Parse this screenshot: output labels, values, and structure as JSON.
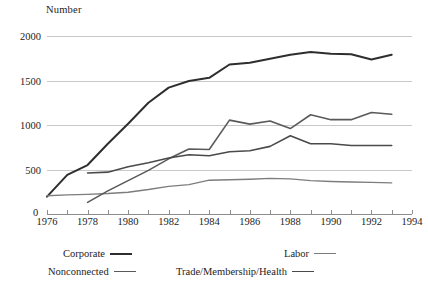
{
  "chart_data": {
    "type": "line",
    "title": "",
    "ylabel": "Number",
    "xlabel": "",
    "xlim": [
      1976,
      1994
    ],
    "ylim": [
      0,
      2000
    ],
    "grid": true,
    "legend_position": "bottom",
    "y_ticks": [
      0,
      500,
      1000,
      1500,
      2000
    ],
    "y_tick_labels": [
      "0",
      "500",
      "1000",
      "1500",
      "2000"
    ],
    "x_ticks": [
      1976,
      1978,
      1980,
      1982,
      1984,
      1986,
      1988,
      1990,
      1992,
      1994
    ],
    "x_tick_labels": [
      "1976",
      "1978",
      "1980",
      "1982",
      "1984",
      "1986",
      "1988",
      "1990",
      "1992",
      "1994"
    ],
    "x_minor_ticks": [
      1976,
      1977,
      1978,
      1979,
      1980,
      1981,
      1982,
      1983,
      1984,
      1985,
      1986,
      1987,
      1988,
      1989,
      1990,
      1991,
      1992,
      1993,
      1994
    ],
    "series": [
      {
        "name": "Corporate",
        "color": "#2e2e2e",
        "width": 2.0,
        "x": [
          1976,
          1977,
          1978,
          1979,
          1980,
          1981,
          1982,
          1983,
          1984,
          1985,
          1986,
          1987,
          1988,
          1989,
          1990,
          1991,
          1992,
          1993
        ],
        "values": [
          195,
          440,
          550,
          790,
          1015,
          1250,
          1420,
          1495,
          1530,
          1680,
          1700,
          1745,
          1790,
          1820,
          1800,
          1795,
          1735,
          1790
        ]
      },
      {
        "name": "Labor",
        "color": "#7d7d7d",
        "width": 1.4,
        "x": [
          1976,
          1977,
          1978,
          1979,
          1980,
          1981,
          1982,
          1983,
          1984,
          1985,
          1986,
          1987,
          1988,
          1989,
          1990,
          1991,
          1992,
          1993
        ],
        "values": [
          205,
          215,
          220,
          230,
          245,
          275,
          310,
          330,
          380,
          385,
          390,
          400,
          395,
          375,
          365,
          360,
          355,
          350
        ]
      },
      {
        "name": "Nonconnected",
        "color": "#5a5a5a",
        "width": 1.6,
        "x": [
          1978,
          1979,
          1980,
          1981,
          1982,
          1983,
          1984,
          1985,
          1986,
          1987,
          1988,
          1989,
          1990,
          1991,
          1992,
          1993
        ],
        "values": [
          130,
          260,
          375,
          490,
          620,
          730,
          725,
          1055,
          1010,
          1045,
          960,
          1115,
          1060,
          1060,
          1140,
          1120
        ]
      },
      {
        "name": "Trade/Membership/Health",
        "color": "#4a4a4a",
        "width": 1.6,
        "x": [
          1978,
          1979,
          1980,
          1981,
          1982,
          1983,
          1984,
          1985,
          1986,
          1987,
          1988,
          1989,
          1990,
          1991,
          1992,
          1993
        ],
        "values": [
          460,
          470,
          530,
          575,
          630,
          665,
          655,
          700,
          710,
          760,
          880,
          790,
          790,
          770,
          770,
          770
        ]
      }
    ]
  },
  "legend": {
    "items": [
      {
        "label": "Corporate",
        "color": "#2e2e2e",
        "width": 2.0,
        "row": 0,
        "x": 63
      },
      {
        "label": "Labor",
        "color": "#7d7d7d",
        "width": 1.4,
        "row": 0,
        "x": 284
      },
      {
        "label": "Nonconnected",
        "color": "#5a5a5a",
        "width": 1.6,
        "row": 1,
        "x": 48
      },
      {
        "label": "Trade/Membership/Health",
        "color": "#4a4a4a",
        "width": 1.6,
        "row": 1,
        "x": 176
      }
    ]
  },
  "colors": {
    "gridline": "#c9c9c9",
    "axis": "#8d8d8d",
    "text": "#1d1d1d",
    "background": "#ffffff"
  }
}
